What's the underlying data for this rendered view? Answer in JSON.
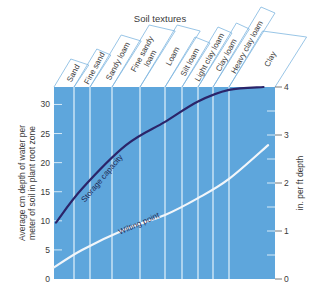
{
  "chart_data": {
    "type": "line",
    "title": "Soil textures",
    "ylabel": "Average cm depth of water per meter of soil in plant root zone",
    "ylabel_lines": [
      "Average cm depth of water per",
      "meter of soil in plant root zone"
    ],
    "y2label": "in. per ft depth",
    "ylim": [
      0,
      33
    ],
    "y2lim": [
      0,
      4
    ],
    "yticks": [
      0,
      5,
      10,
      15,
      20,
      25,
      30
    ],
    "y2ticks": [
      0,
      1,
      2,
      3,
      4
    ],
    "categories": [
      "Sand",
      "Fine sand",
      "Sandy loam",
      "Fine sandy loam",
      "Loam",
      "Silt loam",
      "Light clay loam",
      "Clay loam",
      "Heavy clay loam",
      "Clay"
    ],
    "category_labels": [
      [
        "Sand"
      ],
      [
        "Fine sand"
      ],
      [
        "Sandy loam"
      ],
      [
        "Fine sandy",
        "loam"
      ],
      [
        "Loam"
      ],
      [
        "Silt loam"
      ],
      [
        "Light clay loam"
      ],
      [
        "Clay loam"
      ],
      [
        "Heavy clay loam"
      ],
      [
        "Clay"
      ]
    ],
    "category_bounds_x": [
      54,
      74,
      90,
      112,
      140,
      165,
      182,
      198,
      213,
      229,
      275
    ],
    "series": [
      {
        "name": "Storage capacity",
        "color": "#2b2469",
        "points": [
          [
            0.1,
            9.7
          ],
          [
            1.5,
            15.5
          ],
          [
            3.5,
            23.0
          ],
          [
            5.0,
            27.0
          ],
          [
            7.0,
            30.5
          ],
          [
            9.0,
            32.5
          ],
          [
            9.75,
            33.0
          ]
        ]
      },
      {
        "name": "Wilting point",
        "color": "#f2f6fa",
        "points": [
          [
            0.0,
            2.0
          ],
          [
            1.5,
            5.0
          ],
          [
            3.5,
            8.6
          ],
          [
            5.0,
            11.0
          ],
          [
            7.0,
            13.9
          ],
          [
            9.0,
            17.2
          ],
          [
            9.85,
            23.0
          ]
        ]
      }
    ],
    "grid": false,
    "background_color": "#5ea6dc",
    "divider_color": "#d7ebf8"
  }
}
